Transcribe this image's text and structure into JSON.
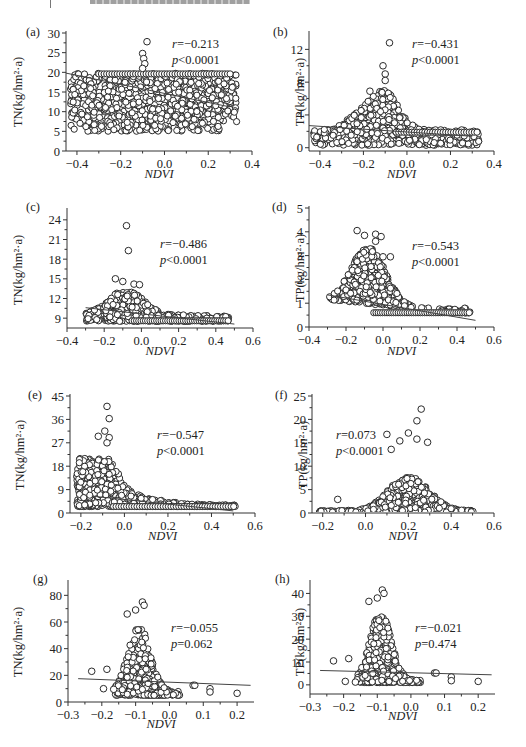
{
  "page": {
    "header_text_truncated": true
  },
  "chart_data": [
    {
      "id": "a",
      "panel_label": "(a)",
      "type": "scatter",
      "xlabel": "NDVI",
      "ylabel": "TN(kg/hm²·a)",
      "xlim": [
        -0.45,
        0.4
      ],
      "ylim": [
        0,
        30
      ],
      "xticks": [
        -0.4,
        -0.2,
        0.0,
        0.2,
        0.4
      ],
      "xtick_labels": [
        "−0.4",
        "−0.2",
        "0.0",
        "0.2",
        "0.4"
      ],
      "yticks": [
        0,
        5,
        10,
        15,
        20,
        25,
        30
      ],
      "ytick_labels": [
        "0",
        "5",
        "10",
        "15",
        "20",
        "25",
        "30"
      ],
      "stats": {
        "r": "−0.213",
        "p": "<0.0001"
      },
      "fit_line": {
        "x": [
          -0.45,
          0.3
        ],
        "y": [
          19.8,
          11.2
        ]
      },
      "point_cloud": {
        "note": "dense cloud (approximate)",
        "x_range": [
          -0.43,
          0.33
        ],
        "y_range": [
          5,
          19.8
        ],
        "cap": 19.8,
        "outliers": [
          [
            -0.08,
            27.8
          ],
          [
            -0.1,
            24.8
          ],
          [
            -0.095,
            23.5
          ],
          [
            -0.09,
            22.2
          ],
          [
            -0.1,
            21
          ]
        ]
      }
    },
    {
      "id": "b",
      "panel_label": "(b)",
      "type": "scatter",
      "xlabel": "NDVI",
      "ylabel": "TP(kg/hm²·a)",
      "xlim": [
        -0.45,
        0.4
      ],
      "ylim": [
        -0.4,
        14
      ],
      "xticks": [
        -0.4,
        -0.2,
        0.0,
        0.2,
        0.4
      ],
      "xtick_labels": [
        "−0.4",
        "−0.2",
        "0.0",
        "0.2",
        "0.4"
      ],
      "yticks": [
        0,
        4,
        8,
        12
      ],
      "ytick_labels": [
        "0",
        "4",
        "8",
        "12"
      ],
      "stats": {
        "r": "−0.431",
        "p": "<0.0001"
      },
      "fit_line": {
        "x": [
          -0.45,
          0.3
        ],
        "y": [
          2.7,
          1.4
        ]
      },
      "point_cloud": {
        "note": "dense cloud peaked near NDVI −0.1 (approximate)",
        "x_range": [
          -0.43,
          0.33
        ],
        "y_range": [
          0.3,
          7
        ],
        "outliers": [
          [
            -0.08,
            12.8
          ],
          [
            -0.11,
            10
          ],
          [
            -0.1,
            9
          ],
          [
            -0.1,
            8.2
          ],
          [
            -0.17,
            6.9
          ]
        ]
      }
    },
    {
      "id": "c",
      "panel_label": "(c)",
      "type": "scatter",
      "xlabel": "NDVI",
      "ylabel": "TN(kg/hm²·a)",
      "xlim": [
        -0.4,
        0.6
      ],
      "ylim": [
        7.5,
        25.5
      ],
      "xticks": [
        -0.4,
        -0.2,
        0.0,
        0.2,
        0.4,
        0.6
      ],
      "xtick_labels": [
        "−0.4",
        "−0.2",
        "0.0",
        "0.2",
        "0.4",
        "0.6"
      ],
      "yticks": [
        9,
        12,
        15,
        18,
        21,
        24
      ],
      "ytick_labels": [
        "9",
        "12",
        "15",
        "18",
        "21",
        "24"
      ],
      "stats": {
        "r": "−0.486",
        "p": "<0.0001"
      },
      "fit_line": {
        "x": [
          -0.3,
          0.5
        ],
        "y": [
          10.6,
          8.1
        ]
      },
      "point_cloud": {
        "note": "dense cloud (approximate)",
        "x_range": [
          -0.3,
          0.47
        ],
        "y_range": [
          8.5,
          13
        ],
        "outliers": [
          [
            -0.08,
            23.1
          ],
          [
            -0.07,
            19.3
          ],
          [
            -0.14,
            15
          ],
          [
            -0.1,
            14.6
          ],
          [
            -0.04,
            14.2
          ],
          [
            -0.01,
            14.1
          ]
        ]
      }
    },
    {
      "id": "d",
      "panel_label": "(d)",
      "type": "scatter",
      "xlabel": "NDVI",
      "ylabel": "TP(kg/hm²·a)",
      "xlim": [
        -0.4,
        0.6
      ],
      "ylim": [
        0,
        5
      ],
      "xticks": [
        -0.4,
        -0.2,
        0.0,
        0.2,
        0.4,
        0.6
      ],
      "xtick_labels": [
        "−0.4",
        "−0.2",
        "0.0",
        "0.2",
        "0.4",
        "0.6"
      ],
      "yticks": [
        0,
        1,
        2,
        3,
        4,
        5
      ],
      "ytick_labels": [
        "0",
        "1",
        "2",
        "3",
        "4",
        "5"
      ],
      "stats": {
        "r": "−0.543",
        "p": "<0.0001"
      },
      "fit_line": {
        "x": [
          -0.3,
          0.5
        ],
        "y": [
          1.35,
          0.28
        ]
      },
      "point_cloud": {
        "note": "dense cloud (approximate)",
        "x_range": [
          -0.31,
          0.47
        ],
        "y_range": [
          0.55,
          3.3
        ],
        "outliers": [
          [
            -0.14,
            4.05
          ],
          [
            -0.1,
            3.85
          ],
          [
            -0.04,
            3.9
          ],
          [
            -0.01,
            3.8
          ],
          [
            -0.04,
            3.6
          ],
          [
            0.0,
            2.95
          ],
          [
            0.04,
            2.95
          ]
        ]
      }
    },
    {
      "id": "e",
      "panel_label": "(e)",
      "type": "scatter",
      "xlabel": "NDVI",
      "ylabel": "TN(kg/hm²·a)",
      "xlim": [
        -0.25,
        0.6
      ],
      "ylim": [
        0,
        45
      ],
      "xticks": [
        -0.2,
        0.0,
        0.2,
        0.4,
        0.6
      ],
      "xtick_labels": [
        "−0.2",
        "0.0",
        "0.2",
        "0.4",
        "0.6"
      ],
      "yticks": [
        0,
        9,
        18,
        27,
        36,
        45
      ],
      "ytick_labels": [
        "0",
        "9",
        "18",
        "27",
        "36",
        "45"
      ],
      "stats": {
        "r": "−0.547",
        "p": "<0.0001"
      },
      "fit_line": {
        "x": [
          -0.15,
          0.5
        ],
        "y": [
          6.5,
          0.8
        ]
      },
      "point_cloud": {
        "note": "dense cloud (approximate)",
        "x_range": [
          -0.22,
          0.51
        ],
        "y_range": [
          2.5,
          21
        ],
        "outliers": [
          [
            -0.08,
            41
          ],
          [
            -0.07,
            36.3
          ],
          [
            -0.09,
            31.5
          ],
          [
            -0.12,
            29.5
          ],
          [
            -0.07,
            29
          ],
          [
            -0.08,
            27
          ]
        ]
      }
    },
    {
      "id": "f",
      "panel_label": "(f)",
      "type": "scatter",
      "xlabel": "NDVI",
      "ylabel": "TP(kg/hm²·a)",
      "xlim": [
        -0.25,
        0.6
      ],
      "ylim": [
        0,
        25
      ],
      "xticks": [
        -0.2,
        0.0,
        0.2,
        0.4,
        0.6
      ],
      "xtick_labels": [
        "−0.2",
        "0.0",
        "0.2",
        "0.4",
        "0.6"
      ],
      "yticks": [
        0,
        5,
        10,
        15,
        20,
        25
      ],
      "ytick_labels": [
        "0",
        "5",
        "10",
        "15",
        "20",
        "25"
      ],
      "stats": {
        "r": "0.073",
        "p": "<0.0001"
      },
      "fit_line": null,
      "point_cloud": {
        "note": "dense cloud peaked near NDVI 0.2 (approximate)",
        "x_range": [
          -0.22,
          0.51
        ],
        "y_range": [
          0.2,
          8
        ],
        "outliers": [
          [
            0.26,
            22.2
          ],
          [
            0.24,
            19.7
          ],
          [
            0.1,
            16.8
          ],
          [
            0.2,
            17.1
          ],
          [
            0.16,
            15.4
          ],
          [
            0.24,
            15.8
          ],
          [
            0.29,
            15.1
          ],
          [
            0.12,
            13.6
          ],
          [
            -0.13,
            2.9
          ]
        ]
      }
    },
    {
      "id": "g",
      "panel_label": "(g)",
      "type": "scatter",
      "xlabel": "NDVI",
      "ylabel": "TN(kg/hm²·a)",
      "xlim": [
        -0.3,
        0.25
      ],
      "ylim": [
        0,
        90
      ],
      "xticks": [
        -0.3,
        -0.2,
        -0.1,
        0.0,
        0.1,
        0.2
      ],
      "xtick_labels": [
        "−0.3",
        "−0.2",
        "−0.1",
        "0.0",
        "0.1",
        "0.2"
      ],
      "yticks": [
        0,
        20,
        40,
        60,
        80
      ],
      "ytick_labels": [
        "0",
        "20",
        "40",
        "60",
        "80"
      ],
      "stats": {
        "r": "−0.055",
        "p": "=0.062"
      },
      "fit_line": {
        "x": [
          -0.27,
          0.24
        ],
        "y": [
          17.5,
          12.5
        ]
      },
      "point_cloud": {
        "note": "cloud concentrated at NDVI −0.15…0.02 (approximate)",
        "x_range": [
          -0.16,
          0.03
        ],
        "y_range": [
          5,
          55
        ],
        "outliers": [
          [
            -0.08,
            75
          ],
          [
            -0.075,
            72.5
          ],
          [
            -0.1,
            69
          ],
          [
            -0.125,
            66
          ],
          [
            -0.23,
            23
          ],
          [
            -0.185,
            24.5
          ],
          [
            -0.195,
            10
          ],
          [
            -0.165,
            9.5
          ],
          [
            0.12,
            10
          ],
          [
            0.12,
            7.5
          ],
          [
            0.2,
            6.5
          ],
          [
            0.07,
            12.5
          ],
          [
            0.075,
            12.5
          ]
        ]
      }
    },
    {
      "id": "h",
      "panel_label": "(h)",
      "type": "scatter",
      "xlabel": "NDVI",
      "ylabel": "TP(kg/hm²·a)",
      "xlim": [
        -0.3,
        0.25
      ],
      "ylim": [
        -4,
        45
      ],
      "xticks": [
        -0.3,
        -0.2,
        -0.1,
        0.0,
        0.1,
        0.2
      ],
      "xtick_labels": [
        "−0.3",
        "−0.2",
        "−0.1",
        "0.0",
        "0.1",
        "0.2"
      ],
      "yticks": [
        0,
        10,
        20,
        30,
        40
      ],
      "ytick_labels": [
        "0",
        "10",
        "20",
        "30",
        "40"
      ],
      "stats": {
        "r": "−0.021",
        "p": "=0.474"
      },
      "fit_line": {
        "x": [
          -0.27,
          0.24
        ],
        "y": [
          6.3,
          4.4
        ]
      },
      "point_cloud": {
        "note": "cloud concentrated at NDVI −0.15…0.02 (approximate)",
        "x_range": [
          -0.16,
          0.03
        ],
        "y_range": [
          1,
          30
        ],
        "outliers": [
          [
            -0.085,
            41.5
          ],
          [
            -0.08,
            40
          ],
          [
            -0.1,
            38
          ],
          [
            -0.125,
            36.5
          ],
          [
            -0.23,
            10.5
          ],
          [
            -0.185,
            11.5
          ],
          [
            -0.195,
            1.5
          ],
          [
            -0.165,
            1.2
          ],
          [
            0.12,
            3.5
          ],
          [
            0.12,
            1.8
          ],
          [
            0.2,
            1.5
          ],
          [
            0.07,
            5.2
          ],
          [
            0.075,
            5.2
          ]
        ]
      }
    }
  ]
}
